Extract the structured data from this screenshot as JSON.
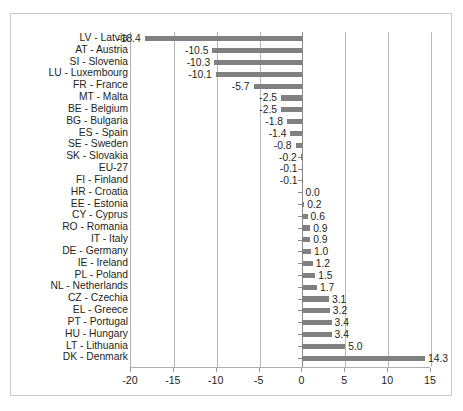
{
  "chart_data": {
    "type": "bar",
    "orientation": "horizontal",
    "title": "",
    "subtitle": "",
    "xlabel": "",
    "ylabel": "",
    "xlim": [
      -20,
      15
    ],
    "xticks": [
      -20,
      -15,
      -10,
      -5,
      0,
      5,
      10,
      15
    ],
    "xtick_labels": [
      "-20",
      "-15",
      "-10",
      "-5",
      "0",
      "5",
      "10",
      "15"
    ],
    "grid": true,
    "legend": null,
    "bar_color": "#808080",
    "categories": [
      "LV - Latvia",
      "AT - Austria",
      "SI - Slovenia",
      "LU - Luxembourg",
      "FR - France",
      "MT - Malta",
      "BE - Belgium",
      "BG - Bulgaria",
      "ES - Spain",
      "SE - Sweden",
      "SK - Slovakia",
      "EU-27",
      "FI - Finland",
      "HR - Croatia",
      "EE - Estonia",
      "CY - Cyprus",
      "RO - Romania",
      "IT - Italy",
      "DE - Germany",
      "IE - Ireland",
      "PL - Poland",
      "NL - Netherlands",
      "CZ - Czechia",
      "EL - Greece",
      "PT - Portugal",
      "HU - Hungary",
      "LT - Lithuania",
      "DK - Denmark"
    ],
    "values": [
      -18.4,
      -10.5,
      -10.3,
      -10.1,
      -5.7,
      -2.5,
      -2.5,
      -1.8,
      -1.4,
      -0.8,
      -0.2,
      -0.1,
      -0.1,
      0.0,
      0.2,
      0.6,
      0.9,
      0.9,
      1.0,
      1.2,
      1.5,
      1.7,
      3.1,
      3.2,
      3.4,
      3.4,
      5.0,
      14.3
    ],
    "data_labels": [
      "-18.4",
      "-10.5",
      "-10.3",
      "-10.1",
      "-5.7",
      "-2.5",
      "-2.5",
      "-1.8",
      "-1.4",
      "-0.8",
      "-0.2",
      "-0.1",
      "-0.1",
      "0.0",
      "0.2",
      "0.6",
      "0.9",
      "0.9",
      "1.0",
      "1.2",
      "1.5",
      "1.7",
      "3.1",
      "3.2",
      "3.4",
      "3.4",
      "5.0",
      "14.3"
    ]
  }
}
